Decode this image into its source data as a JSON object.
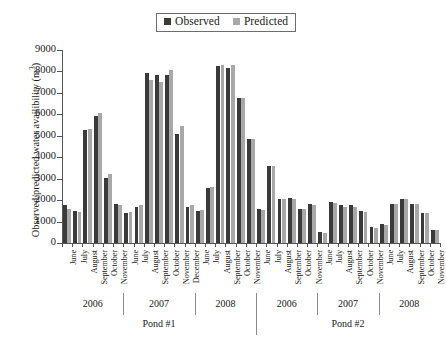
{
  "legend": {
    "entries": [
      {
        "label": "Observed",
        "color": "#3a3a3a"
      },
      {
        "label": "Predicted",
        "color": "#a8a8a8"
      }
    ]
  },
  "axes": {
    "ylabel_text": "Observed/predicted water availibility (m",
    "ylabel_sup": "3",
    "ylabel_close": ")",
    "yticks": [
      "0",
      "1000",
      "2000",
      "3000",
      "4000",
      "5000",
      "6000",
      "7000",
      "8000",
      "9000"
    ],
    "ylim": [
      0,
      9000
    ]
  },
  "groups": {
    "ponds": [
      {
        "label": "Pond #1",
        "span_start": 0,
        "span_count": 19
      },
      {
        "label": "Pond #2",
        "span_start": 19,
        "span_count": 18
      }
    ],
    "years": [
      {
        "label": "2006",
        "span_start": 0,
        "span_count": 6
      },
      {
        "label": "2007",
        "span_start": 6,
        "span_count": 7
      },
      {
        "label": "2008",
        "span_start": 13,
        "span_count": 6
      },
      {
        "label": "2006",
        "span_start": 19,
        "span_count": 6
      },
      {
        "label": "2007",
        "span_start": 25,
        "span_count": 6
      },
      {
        "label": "2008",
        "span_start": 31,
        "span_count": 6
      }
    ]
  },
  "chart_data": {
    "type": "bar",
    "title": "",
    "xlabel": "",
    "ylabel": "Observed/predicted water availibility (m3)",
    "ylim": [
      0,
      9000
    ],
    "ytick_step": 1000,
    "grid": false,
    "legend_position": "top-center",
    "categories": [
      "June",
      "July",
      "August",
      "September",
      "October",
      "November",
      "June",
      "July",
      "August",
      "September",
      "October",
      "November",
      "December",
      "June",
      "July",
      "August",
      "September",
      "October",
      "November",
      "June",
      "July",
      "August",
      "September",
      "October",
      "November",
      "June",
      "July",
      "August",
      "September",
      "October",
      "November",
      "June",
      "July",
      "August",
      "September",
      "October",
      "November"
    ],
    "group_keys": [
      "Pond #1 2006",
      "Pond #1 2006",
      "Pond #1 2006",
      "Pond #1 2006",
      "Pond #1 2006",
      "Pond #1 2006",
      "Pond #1 2007",
      "Pond #1 2007",
      "Pond #1 2007",
      "Pond #1 2007",
      "Pond #1 2007",
      "Pond #1 2007",
      "Pond #1 2007",
      "Pond #1 2008",
      "Pond #1 2008",
      "Pond #1 2008",
      "Pond #1 2008",
      "Pond #1 2008",
      "Pond #1 2008",
      "Pond #2 2006",
      "Pond #2 2006",
      "Pond #2 2006",
      "Pond #2 2006",
      "Pond #2 2006",
      "Pond #2 2006",
      "Pond #2 2007",
      "Pond #2 2007",
      "Pond #2 2007",
      "Pond #2 2007",
      "Pond #2 2007",
      "Pond #2 2007",
      "Pond #2 2008",
      "Pond #2 2008",
      "Pond #2 2008",
      "Pond #2 2008",
      "Pond #2 2008",
      "Pond #2 2008"
    ],
    "series": [
      {
        "name": "Observed",
        "color": "#3a3a3a",
        "values": [
          1750,
          1500,
          5250,
          5900,
          3050,
          1800,
          1400,
          1700,
          7950,
          7850,
          7850,
          5100,
          1700,
          1500,
          2550,
          8250,
          8150,
          6750,
          4850,
          1600,
          3600,
          2050,
          2100,
          1600,
          1800,
          500,
          1900,
          1750,
          1750,
          1500,
          750,
          900,
          1800,
          2050,
          1800,
          1400,
          600
        ]
      },
      {
        "name": "Predicted",
        "color": "#a8a8a8",
        "values": [
          1600,
          1450,
          5300,
          6050,
          3200,
          1750,
          1450,
          1750,
          7600,
          7500,
          8050,
          5450,
          1750,
          1550,
          2600,
          8300,
          8300,
          6750,
          4850,
          1550,
          3600,
          2050,
          2050,
          1600,
          1750,
          450,
          1850,
          1700,
          1700,
          1450,
          700,
          850,
          1800,
          2050,
          1800,
          1400,
          600
        ]
      }
    ]
  }
}
